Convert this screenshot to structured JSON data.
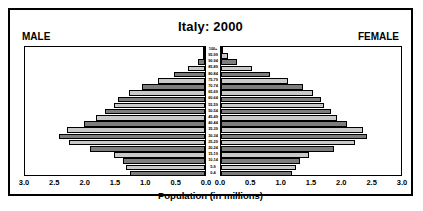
{
  "chart_data": {
    "type": "bar",
    "subtype": "population-pyramid",
    "title": "Italy: 2000",
    "xlabel": "Population (in millions)",
    "ylabel": "",
    "left_series_label": "MALE",
    "right_series_label": "FEMALE",
    "xlim": [
      0,
      3.0
    ],
    "xticks": [
      3.0,
      2.5,
      2.0,
      1.5,
      1.0,
      0.5,
      0.0
    ],
    "xtick_labels_left": [
      "3.0",
      "2.5",
      "2.0",
      "1.5",
      "1.0",
      "0.5",
      "0.0"
    ],
    "xtick_labels_right": [
      "0.0",
      "0.5",
      "1.0",
      "1.5",
      "2.0",
      "2.5",
      "3.0"
    ],
    "grid": false,
    "legend": "none",
    "categories": [
      "100+",
      "95-99",
      "90-94",
      "85-89",
      "80-84",
      "75-79",
      "70-74",
      "65-69",
      "60-64",
      "55-59",
      "50-54",
      "45-49",
      "40-44",
      "35-39",
      "30-34",
      "25-29",
      "20-24",
      "15-19",
      "10-14",
      "5-9",
      "0-4"
    ],
    "series": [
      {
        "name": "MALE",
        "values": [
          0.01,
          0.04,
          0.12,
          0.28,
          0.52,
          0.78,
          1.05,
          1.28,
          1.45,
          1.52,
          1.68,
          1.82,
          2.02,
          2.32,
          2.45,
          2.28,
          1.92,
          1.52,
          1.38,
          1.32,
          1.25
        ]
      },
      {
        "name": "FEMALE",
        "values": [
          0.03,
          0.11,
          0.27,
          0.52,
          0.82,
          1.12,
          1.38,
          1.55,
          1.68,
          1.72,
          1.85,
          1.95,
          2.12,
          2.38,
          2.45,
          2.25,
          1.9,
          1.48,
          1.32,
          1.26,
          1.19
        ]
      }
    ],
    "bar_shades": [
      "#7d7d7d",
      "#c9c9c9"
    ]
  },
  "colors": {
    "bar_dark": "#7d7d7d",
    "bar_light": "#c9c9c9",
    "frame": "#000000",
    "background": "#ffffff"
  }
}
